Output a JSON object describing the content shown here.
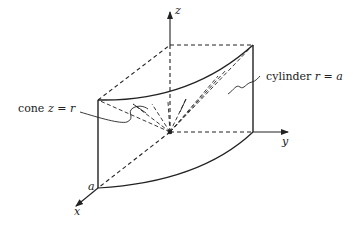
{
  "figure": {
    "type": "3d-region-diagram",
    "axes": {
      "x_label": "x",
      "y_label": "y",
      "z_label": "z"
    },
    "labels": {
      "cone_prefix": "cone ",
      "cone_eq": "z = r",
      "cylinder_prefix": "cylinder ",
      "cylinder_eq": "r = a",
      "radius_marker": "a"
    },
    "colors": {
      "line": "#222222",
      "background": "#ffffff"
    }
  }
}
